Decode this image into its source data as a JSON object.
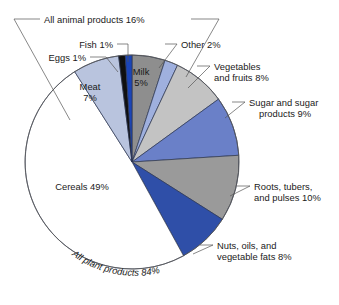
{
  "chart_data": {
    "type": "pie",
    "title": "",
    "subtitle": "",
    "xlabel": "",
    "ylabel": "",
    "legend_position": "none",
    "grid": false,
    "units": "percent",
    "total": 100,
    "start_angle_deg": -90,
    "direction": "clockwise",
    "categories": [
      "Milk",
      "Other",
      "Vegetables and fruits",
      "Sugar and sugar products",
      "Roots, tubers, and pulses",
      "Nuts, oils, and vegetable fats",
      "Cereals",
      "Meat",
      "Eggs",
      "Fish"
    ],
    "values": [
      5,
      2,
      8,
      9,
      10,
      8,
      49,
      7,
      1,
      1
    ],
    "colors": [
      "#8e8e8e",
      "#9fb0de",
      "#c3c3c3",
      "#6a80c8",
      "#9a9a9a",
      "#2f4fa8",
      "#ffffff",
      "#b9c4de",
      "#101010",
      "#1b45b8"
    ],
    "slices": [
      {
        "name": "Milk",
        "value": 5,
        "label": "Milk",
        "value_label": "5%",
        "color": "#8e8e8e",
        "label_placement": "inside"
      },
      {
        "name": "Other",
        "value": 2,
        "label": "Other 2%",
        "value_label": "2%",
        "color": "#9fb0de",
        "label_placement": "callout"
      },
      {
        "name": "Vegetables and fruits",
        "value": 8,
        "label": "Vegetables",
        "label_line2": "and fruits 8%",
        "value_label": "8%",
        "color": "#c3c3c3",
        "label_placement": "callout"
      },
      {
        "name": "Sugar and sugar products",
        "value": 9,
        "label": "Sugar and sugar",
        "label_line2": "products 9%",
        "value_label": "9%",
        "color": "#6a80c8",
        "label_placement": "callout"
      },
      {
        "name": "Roots, tubers, and pulses",
        "value": 10,
        "label": "Roots, tubers,",
        "label_line2": "and pulses 10%",
        "value_label": "10%",
        "color": "#9a9a9a",
        "label_placement": "callout"
      },
      {
        "name": "Nuts, oils, and vegetable fats",
        "value": 8,
        "label": "Nuts, oils, and",
        "label_line2": "vegetable fats 8%",
        "value_label": "8%",
        "color": "#2f4fa8",
        "label_placement": "callout"
      },
      {
        "name": "Cereals",
        "value": 49,
        "label": "Cereals 49%",
        "value_label": "49%",
        "color": "#ffffff",
        "label_placement": "inside"
      },
      {
        "name": "Meat",
        "value": 7,
        "label": "Meat",
        "value_label": "7%",
        "color": "#b9c4de",
        "label_placement": "inside"
      },
      {
        "name": "Eggs",
        "value": 1,
        "label": "Eggs 1%",
        "value_label": "1%",
        "color": "#101010",
        "label_placement": "callout"
      },
      {
        "name": "Fish",
        "value": 1,
        "label": "Fish 1%",
        "value_label": "1%",
        "color": "#1b45b8",
        "label_placement": "callout"
      }
    ],
    "groups": [
      {
        "name": "All animal products",
        "label": "All animal products 16%",
        "value": 16,
        "members": [
          "Meat",
          "Eggs",
          "Fish",
          "Milk",
          "Other"
        ],
        "bracket": "top"
      },
      {
        "name": "All plant products",
        "label": "All plant products 84%",
        "value": 84,
        "members": [
          "Vegetables and fruits",
          "Sugar and sugar products",
          "Roots, tubers, and pulses",
          "Nuts, oils, and vegetable fats",
          "Cereals"
        ],
        "bracket": "bottom-arc"
      }
    ],
    "annotations": [
      {
        "text": "All animal products 16%"
      },
      {
        "text": "All plant products 84%"
      }
    ]
  },
  "labels": {
    "all_animal_products": "All animal products 16%",
    "all_plant_products": "All plant products 84%",
    "eggs": "Eggs 1%",
    "fish": "Fish 1%",
    "other": "Other 2%",
    "vegetables_line1": "Vegetables",
    "vegetables_line2": "and fruits 8%",
    "sugar_line1": "Sugar and sugar",
    "sugar_line2": "products 9%",
    "roots_line1": "Roots, tubers,",
    "roots_line2": "and pulses 10%",
    "nuts_line1": "Nuts, oils, and",
    "nuts_line2": "vegetable fats 8%",
    "meat_line1": "Meat",
    "meat_line2": "7%",
    "milk_line1": "Milk",
    "milk_line2": "5%",
    "cereals": "Cereals 49%"
  }
}
